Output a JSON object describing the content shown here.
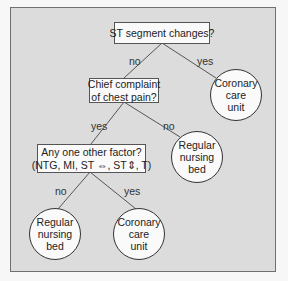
{
  "diagram": {
    "type": "decision-tree",
    "colors": {
      "frame_background": "#dcdcdc",
      "node_fill": "#fafafa",
      "line": "#555555"
    },
    "nodes": {
      "root": {
        "line1": "ST segment changes?"
      },
      "chest_pain": {
        "line1": "Chief complaint",
        "line2": "of chest pain?"
      },
      "other_factor": {
        "line1": "Any one other factor?",
        "line2": "(NTG, MI, ST ⇔, ST⇕, T)"
      },
      "ccu_top": {
        "line1": "Coronary",
        "line2": "care",
        "line3": "unit"
      },
      "rnb_mid": {
        "line1": "Regular",
        "line2": "nursing",
        "line3": "bed"
      },
      "rnb_bottom": {
        "line1": "Regular",
        "line2": "nursing",
        "line3": "bed"
      },
      "ccu_bottom": {
        "line1": "Coronary",
        "line2": "care",
        "line3": "unit"
      }
    },
    "edges": {
      "root_no": "no",
      "root_yes": "yes",
      "chest_yes": "yes",
      "chest_no": "no",
      "factor_no": "no",
      "factor_yes": "yes"
    }
  }
}
